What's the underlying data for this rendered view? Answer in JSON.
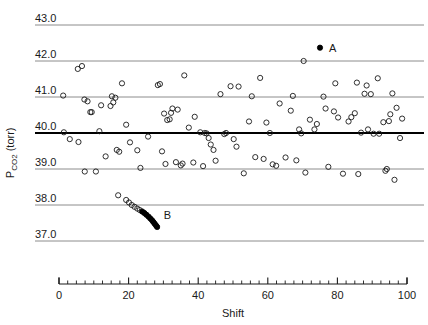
{
  "chart_data": {
    "type": "scatter",
    "title": "",
    "xlabel": "Shift",
    "ylabel": "PCO2 (torr)",
    "ylabel_main": "P",
    "ylabel_sub": "CO2",
    "ylabel_units": " (torr)",
    "xlim": [
      0,
      100
    ],
    "ylim": [
      36.6,
      43.3
    ],
    "grid": "horizontal-only",
    "legend": "none",
    "x_ticks_major": [
      0,
      20,
      40,
      60,
      80,
      100
    ],
    "x_tick_labels": [
      "0",
      "20",
      "40",
      "60",
      "80",
      "100"
    ],
    "x_ticks_minor_step": 2.5,
    "y_ticks": [
      37.0,
      38.0,
      39.0,
      40.0,
      41.0,
      42.0,
      43.0
    ],
    "y_tick_labels": [
      "37.0",
      "38.0",
      "39.0",
      "40.0",
      "41.0",
      "42.0",
      "43.0"
    ],
    "center_line_value": 40.0,
    "center_line_emphasis": "bold",
    "colors": {
      "gridline": "#808080",
      "centerline": "#000000",
      "marker_open_stroke": "#1a1a1a",
      "marker_filled_fill": "#000000",
      "axis": "#1a1a1a",
      "background": "#ffffff"
    },
    "annotations": [
      {
        "label": "A",
        "x": 75.0,
        "y": 42.37,
        "marker": "filled",
        "label_dx": 9,
        "label_dy": 4
      },
      {
        "label": "B",
        "x": 27.5,
        "y": 37.72,
        "marker": "none",
        "label_dx": 9,
        "label_dy": 4
      }
    ],
    "series": [
      {
        "name": "routine-observations",
        "marker": "open-circle",
        "points": [
          [
            1.2,
            41.04
          ],
          [
            1.4,
            40.02
          ],
          [
            3.1,
            39.83
          ],
          [
            5.4,
            41.78
          ],
          [
            5.6,
            39.75
          ],
          [
            6.6,
            41.86
          ],
          [
            7.3,
            40.93
          ],
          [
            7.4,
            38.93
          ],
          [
            8.2,
            40.88
          ],
          [
            9.0,
            40.58
          ],
          [
            9.4,
            40.58
          ],
          [
            10.6,
            38.93
          ],
          [
            11.6,
            40.05
          ],
          [
            12.1,
            40.77
          ],
          [
            13.4,
            39.35
          ],
          [
            14.8,
            40.75
          ],
          [
            15.2,
            41.02
          ],
          [
            15.6,
            40.85
          ],
          [
            16.2,
            40.98
          ],
          [
            16.6,
            39.53
          ],
          [
            17.3,
            39.48
          ],
          [
            18.1,
            41.38
          ],
          [
            19.3,
            40.23
          ],
          [
            20.4,
            39.74
          ],
          [
            22.5,
            39.52
          ],
          [
            23.4,
            39.03
          ],
          [
            25.6,
            39.9
          ],
          [
            28.4,
            41.33
          ],
          [
            29.0,
            41.36
          ],
          [
            29.6,
            39.49
          ],
          [
            30.2,
            40.54
          ],
          [
            30.6,
            39.14
          ],
          [
            31.1,
            40.36
          ],
          [
            31.8,
            40.38
          ],
          [
            32.2,
            40.56
          ],
          [
            32.6,
            40.68
          ],
          [
            33.6,
            39.19
          ],
          [
            34.1,
            40.65
          ],
          [
            35.0,
            39.1
          ],
          [
            35.5,
            39.15
          ],
          [
            36.0,
            41.6
          ],
          [
            37.3,
            40.15
          ],
          [
            38.6,
            39.18
          ],
          [
            39.0,
            40.45
          ],
          [
            40.6,
            40.02
          ],
          [
            41.4,
            39.08
          ],
          [
            41.9,
            40.0
          ],
          [
            42.4,
            39.99
          ],
          [
            43.0,
            39.86
          ],
          [
            43.6,
            39.68
          ],
          [
            44.4,
            39.53
          ],
          [
            45.0,
            39.23
          ],
          [
            46.4,
            41.08
          ],
          [
            47.5,
            39.97
          ],
          [
            48.0,
            40.0
          ],
          [
            49.3,
            41.3
          ],
          [
            50.2,
            39.83
          ],
          [
            51.0,
            39.62
          ],
          [
            51.6,
            41.29
          ],
          [
            53.1,
            38.88
          ],
          [
            54.6,
            40.32
          ],
          [
            55.4,
            41.02
          ],
          [
            56.4,
            39.33
          ],
          [
            57.8,
            41.53
          ],
          [
            58.8,
            39.28
          ],
          [
            59.6,
            40.29
          ],
          [
            60.6,
            40.0
          ],
          [
            61.4,
            39.13
          ],
          [
            62.4,
            39.09
          ],
          [
            63.4,
            40.82
          ],
          [
            65.1,
            39.32
          ],
          [
            66.6,
            40.62
          ],
          [
            67.2,
            41.03
          ],
          [
            68.2,
            39.24
          ],
          [
            69.0,
            40.1
          ],
          [
            69.6,
            39.99
          ],
          [
            70.3,
            42.0
          ],
          [
            70.8,
            38.9
          ],
          [
            72.1,
            40.37
          ],
          [
            73.4,
            40.1
          ],
          [
            74.1,
            40.25
          ],
          [
            76.0,
            41.01
          ],
          [
            76.6,
            40.68
          ],
          [
            77.4,
            39.06
          ],
          [
            79.0,
            40.6
          ],
          [
            79.4,
            41.38
          ],
          [
            80.2,
            40.43
          ],
          [
            81.6,
            38.87
          ],
          [
            83.2,
            40.32
          ],
          [
            84.0,
            40.44
          ],
          [
            85.0,
            40.55
          ],
          [
            85.6,
            41.4
          ],
          [
            86.0,
            38.86
          ],
          [
            86.8,
            40.01
          ],
          [
            87.8,
            41.09
          ],
          [
            88.4,
            41.32
          ],
          [
            88.8,
            40.1
          ],
          [
            89.6,
            41.08
          ],
          [
            90.4,
            39.98
          ],
          [
            91.6,
            41.52
          ],
          [
            92.0,
            39.98
          ],
          [
            93.2,
            40.3
          ],
          [
            93.8,
            38.95
          ],
          [
            94.2,
            39.0
          ],
          [
            94.8,
            40.33
          ],
          [
            95.2,
            40.52
          ],
          [
            95.8,
            41.1
          ],
          [
            96.4,
            38.7
          ],
          [
            97.0,
            40.7
          ],
          [
            98.0,
            39.86
          ],
          [
            98.6,
            40.4
          ]
        ]
      },
      {
        "name": "cluster-B-open",
        "marker": "open-circle",
        "points": [
          [
            17.0,
            38.27
          ],
          [
            19.3,
            38.14
          ],
          [
            20.1,
            38.07
          ],
          [
            20.9,
            38.0
          ],
          [
            21.7,
            37.95
          ],
          [
            22.5,
            37.9
          ],
          [
            23.2,
            37.86
          ]
        ]
      },
      {
        "name": "cluster-B-filled",
        "marker": "filled-circle",
        "points": [
          [
            23.9,
            37.82
          ],
          [
            24.5,
            37.78
          ],
          [
            25.1,
            37.73
          ],
          [
            25.7,
            37.68
          ],
          [
            26.2,
            37.63
          ],
          [
            26.7,
            37.58
          ],
          [
            27.1,
            37.53
          ],
          [
            27.5,
            37.48
          ],
          [
            27.9,
            37.43
          ],
          [
            28.2,
            37.39
          ]
        ]
      },
      {
        "name": "point-A",
        "marker": "filled-circle",
        "points": [
          [
            75.0,
            42.37
          ]
        ]
      }
    ]
  }
}
